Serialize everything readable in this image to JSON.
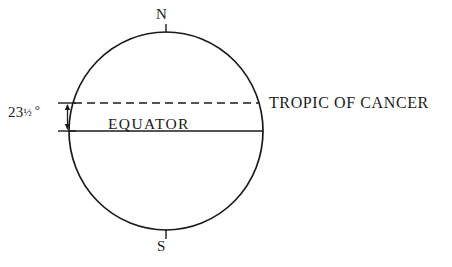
{
  "diagram": {
    "background_color": "#ffffff",
    "line_color": "#1b1b1b",
    "labels": {
      "north_pole": "N",
      "south_pole": "S",
      "equator": "EQUATOR",
      "tropic_of_cancer": "TROPIC OF CANCER",
      "angle_value": "23",
      "angle_fraction": "½",
      "angle_degree_symbol": "°",
      "angle_full": "23½ °"
    },
    "geometry": {
      "circle_center_x": 166,
      "circle_center_y": 131,
      "circle_radius_x": 97,
      "circle_radius_y": 99,
      "equator_line_y": 131,
      "tropic_line_y": 103,
      "tropic_line_style": "dashed",
      "equator_line_style": "solid",
      "angle_tick_left_x": 60,
      "angle_arrow_x": 68,
      "pole_stub_length": 8
    }
  }
}
